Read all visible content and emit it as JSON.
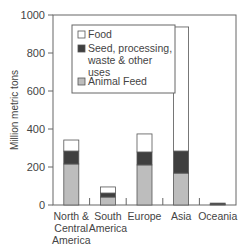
{
  "chart_data": {
    "type": "bar",
    "stacked": true,
    "title": "",
    "xlabel": "",
    "ylabel": "Million metric tons",
    "ylim": [
      0,
      1000
    ],
    "yticks": [
      0,
      200,
      400,
      600,
      800,
      1000
    ],
    "grid": false,
    "legend_position": "upper-left-inside",
    "categories": [
      "North & Central America",
      "South America",
      "Europe",
      "Asia",
      "Oceania"
    ],
    "category_label_lines": [
      [
        "North &",
        "Central",
        "America"
      ],
      [
        "South",
        "America"
      ],
      [
        "Europe"
      ],
      [
        "Asia"
      ],
      [
        "Oceania"
      ]
    ],
    "series": [
      {
        "name": "Animal Feed",
        "color": "#bdbdbd",
        "values": [
          216,
          42,
          211,
          168,
          3
        ]
      },
      {
        "name": "Seed, processing, waste & other uses",
        "color": "#3f3f3f",
        "values": [
          68,
          21,
          68,
          116,
          7
        ]
      },
      {
        "name": "Food",
        "color": "#ffffff",
        "values": [
          58,
          32,
          95,
          653,
          0
        ]
      }
    ],
    "totals": [
      342,
      95,
      374,
      937,
      10
    ]
  },
  "legend": {
    "items": [
      {
        "label_lines": [
          "Food"
        ],
        "color": "#ffffff"
      },
      {
        "label_lines": [
          "Seed, processing,",
          "waste & other",
          "uses"
        ],
        "color": "#3f3f3f"
      },
      {
        "label_lines": [
          "Animal Feed"
        ],
        "color": "#bdbdbd"
      }
    ]
  }
}
